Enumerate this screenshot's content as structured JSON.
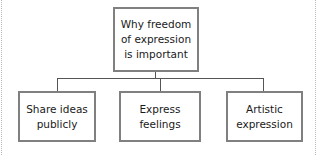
{
  "diagram": {
    "root": {
      "label": "Why freedom of expression is important",
      "lines": [
        "Why freedom",
        "of expression",
        "is important"
      ]
    },
    "children": [
      {
        "label": "Share ideas publicly",
        "lines": [
          "Share ideas",
          "publicly"
        ]
      },
      {
        "label": "Express feelings",
        "lines": [
          "Express",
          "feelings"
        ]
      },
      {
        "label": "Artistic expression",
        "lines": [
          "Artistic",
          "expression"
        ]
      }
    ],
    "colors": {
      "box_border": "#808080",
      "connector": "#555555",
      "text": "#1a1a1a"
    }
  }
}
